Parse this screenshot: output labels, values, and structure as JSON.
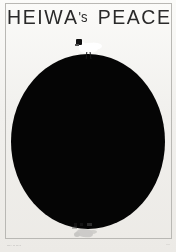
{
  "artwork": {
    "title_main": "HEIWA",
    "title_possessive": "'s",
    "title_second": "PEACE",
    "title_full": "HEIWA's PEACE",
    "background_color": "#f2f1ee",
    "ink_color": "#050505",
    "frame_color": "#b9b8b4",
    "title_color": "#2a2a2a"
  },
  "elements": {
    "circle_label": "black-circle",
    "dove_label": "white-dove",
    "reflection_label": "dove-reflection"
  },
  "credits": {
    "left": "···· ·· ····",
    "right": "····"
  }
}
